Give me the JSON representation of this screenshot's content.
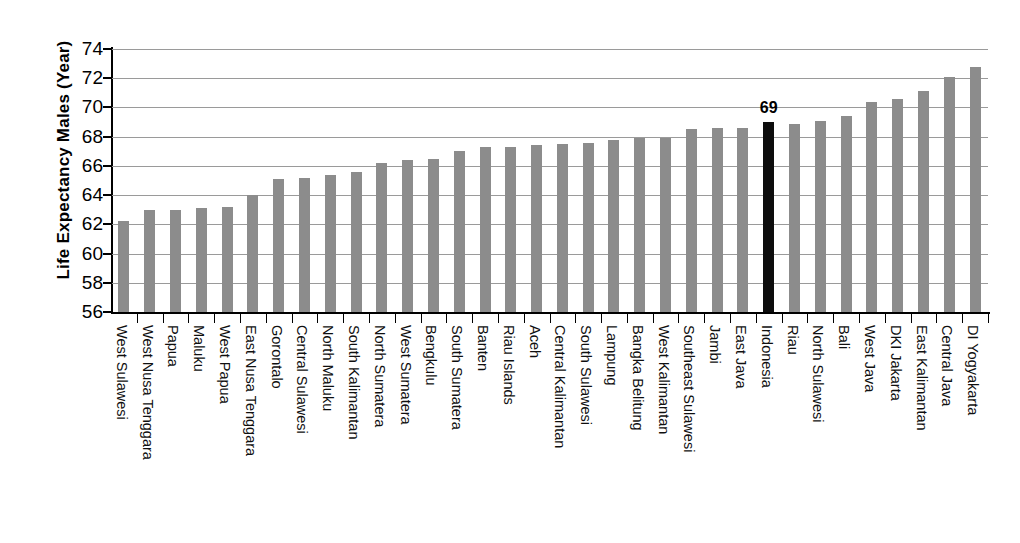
{
  "chart_data": {
    "type": "bar",
    "title": "",
    "subtitle": "",
    "xlabel": "",
    "ylabel": "Life Expectancy Males (Year)",
    "ylim": [
      56,
      74
    ],
    "ytick_step": 2,
    "yticks": [
      56,
      58,
      60,
      62,
      64,
      66,
      68,
      70,
      72,
      74
    ],
    "grid": true,
    "legend": "none",
    "bar_color": "#8c8c8c",
    "highlight_color": "#0d0d0d",
    "highlight_category": "Indonesia",
    "annotations": [
      {
        "category": "Indonesia",
        "text": "69"
      }
    ],
    "categories": [
      "West Sulawesi",
      "West Nusa Tenggara",
      "Papua",
      "Maluku",
      "West Papua",
      "East Nusa Tenggara",
      "Gorontalo",
      "Central Sulawesi",
      "North Maluku",
      "South Kalimantan",
      "North Sumatera",
      "West Sumatera",
      "Bengkulu",
      "South Sumatera",
      "Banten",
      "Riau Islands",
      "Aceh",
      "Central Kalimantan",
      "South Sulawesi",
      "Lampung",
      "Bangka Belitung",
      "West Kalimantan",
      "Southeast Sulawesi",
      "Jambi",
      "East Java",
      "Indonesia",
      "Riau",
      "North Sulawesi",
      "Bali",
      "West Java",
      "DKI Jakarta",
      "East Kalimantan",
      "Central Java",
      "DI Yogyakarta"
    ],
    "values": [
      62.2,
      63.0,
      63.0,
      63.1,
      63.2,
      64.0,
      65.1,
      65.2,
      65.4,
      65.6,
      66.2,
      66.4,
      66.5,
      67.0,
      67.3,
      67.3,
      67.4,
      67.5,
      67.6,
      67.8,
      67.9,
      67.9,
      68.5,
      68.6,
      68.6,
      69.0,
      68.9,
      69.1,
      69.4,
      70.4,
      70.6,
      71.1,
      72.1,
      72.8
    ]
  }
}
